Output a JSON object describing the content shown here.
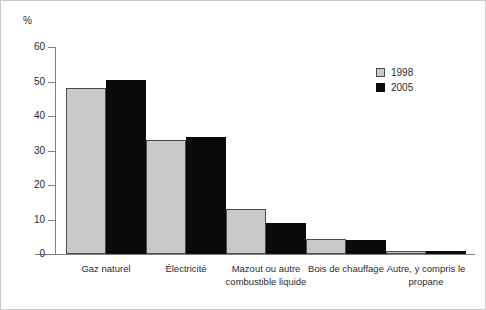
{
  "chart_data": {
    "type": "bar",
    "title": "",
    "subtitle": "",
    "xlabel": "",
    "ylabel": "%",
    "ylim": [
      0,
      60
    ],
    "yticks": [
      "0",
      "10",
      "20",
      "30",
      "40",
      "50",
      "60"
    ],
    "grid": false,
    "legend_position": "top-right",
    "categories": [
      "Gaz naturel",
      "Électricité",
      "Mazout ou autre combustible liquide",
      "Bois de chauffage",
      "Autre, y compris le propane"
    ],
    "category_lines": [
      [
        "Gaz naturel"
      ],
      [
        "Électricité"
      ],
      [
        "Mazout ou autre",
        "combustible liquide"
      ],
      [
        "Bois de chauffage"
      ],
      [
        "Autre, y compris le",
        "propane"
      ]
    ],
    "series": [
      {
        "name": "1998",
        "color": "#c9c9c9",
        "values": [
          48,
          33,
          13,
          4.3,
          1
        ]
      },
      {
        "name": "2005",
        "color": "#0a0a0a",
        "values": [
          50.5,
          34,
          9,
          4,
          1
        ]
      }
    ]
  },
  "legend": {
    "items": [
      {
        "label": "1998",
        "swatch": "light-gray-square"
      },
      {
        "label": "2005",
        "swatch": "black-square"
      }
    ]
  },
  "axis": {
    "unit_label": "%"
  }
}
